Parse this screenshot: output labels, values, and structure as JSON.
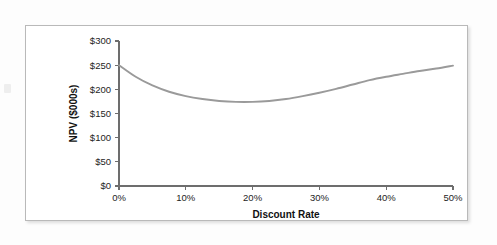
{
  "figure": {
    "background": "#ffffff",
    "frame_color": "#b9b9b9"
  },
  "chart_data": {
    "type": "line",
    "title": "",
    "xlabel": "Discount Rate",
    "ylabel": "NPV ($000s)",
    "xlim": [
      0,
      50
    ],
    "ylim": [
      0,
      300
    ],
    "grid": false,
    "legend": false,
    "line_color": "#9a9a9a",
    "axis_color": "#6d6d6d",
    "x_ticks": [
      0,
      10,
      20,
      30,
      40,
      50
    ],
    "x_tick_labels": [
      "0%",
      "10%",
      "20%",
      "30%",
      "40%",
      "50%"
    ],
    "y_ticks": [
      0,
      50,
      100,
      150,
      200,
      250,
      300
    ],
    "y_tick_labels": [
      "$0",
      "$50",
      "$100",
      "$150",
      "$200",
      "$250",
      "$300"
    ],
    "x": [
      0,
      2.5,
      5,
      7.5,
      10,
      12.5,
      15,
      17.5,
      20,
      22.5,
      25,
      27.5,
      30,
      32.5,
      35,
      37.5,
      40,
      42.5,
      45,
      47.5,
      50
    ],
    "values": [
      250,
      226,
      208,
      195,
      186,
      180,
      176,
      174,
      174,
      176,
      180,
      186,
      193,
      201,
      210,
      219,
      226,
      232,
      238,
      243,
      249
    ],
    "series": [
      {
        "name": "NPV",
        "values": [
          250,
          226,
          208,
          195,
          186,
          180,
          176,
          174,
          174,
          176,
          180,
          186,
          193,
          201,
          210,
          219,
          226,
          232,
          238,
          243,
          249
        ]
      }
    ],
    "annotations": []
  }
}
